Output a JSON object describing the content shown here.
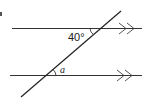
{
  "diagram": {
    "type": "parallel-lines-transversal",
    "corner_label": "a",
    "angles": [
      {
        "label": "40°",
        "position": "top-intersection"
      },
      {
        "label": "a",
        "position": "bottom-intersection"
      }
    ],
    "parallel_marker": "double-arrow",
    "colors": {
      "line": "#333333",
      "background": "#ffffff"
    }
  }
}
